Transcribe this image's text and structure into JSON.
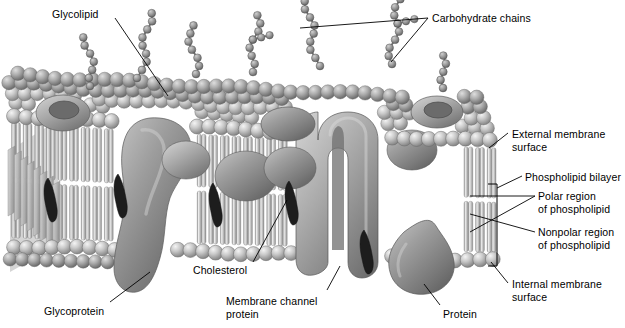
{
  "figure": {
    "width": 625,
    "height": 328,
    "background": "#ffffff"
  },
  "palette": {
    "head_light": "#e9e9e9",
    "head_mid": "#b8b8b8",
    "head_dark": "#7e7e7e",
    "tail_light": "#dcdcdc",
    "tail_mid": "#aeaeae",
    "protein_light": "#b0b0b0",
    "protein_mid": "#8a8a8a",
    "protein_dark": "#5f5f5f",
    "carb_light": "#bdbdbd",
    "carb_dark": "#6e6e6e",
    "cholesterol": "#1c1c1c",
    "interior": "#f2f2f2",
    "outline": "#4a4a4a",
    "leader": "#000000",
    "text": "#000000"
  },
  "labels": [
    {
      "id": "glycolipid",
      "text": "Glycolipid",
      "x": 52,
      "y": 8,
      "align": "left"
    },
    {
      "id": "carbohydrate-chains",
      "text": "Carbohydrate chains",
      "x": 432,
      "y": 12,
      "align": "left"
    },
    {
      "id": "external-membrane",
      "text": "External membrane\nsurface",
      "x": 512,
      "y": 128,
      "align": "left"
    },
    {
      "id": "phospholipid-bilayer",
      "text": "Phospholipid bilayer",
      "x": 525,
      "y": 171,
      "align": "left"
    },
    {
      "id": "polar-region",
      "text": "Polar region\nof phospholipid",
      "x": 538,
      "y": 190,
      "align": "left"
    },
    {
      "id": "nonpolar-region",
      "text": "Nonpolar region\nof phospholipid",
      "x": 538,
      "y": 226,
      "align": "left"
    },
    {
      "id": "internal-membrane",
      "text": "Internal membrane\nsurface",
      "x": 512,
      "y": 278,
      "align": "left"
    },
    {
      "id": "glycoprotein",
      "text": "Glycoprotein",
      "x": 44,
      "y": 305,
      "align": "left"
    },
    {
      "id": "cholesterol",
      "text": "Cholesterol",
      "x": 193,
      "y": 264,
      "align": "left"
    },
    {
      "id": "membrane-channel",
      "text": "Membrane channel\nprotein",
      "x": 226,
      "y": 295,
      "align": "left"
    },
    {
      "id": "protein",
      "text": "Protein",
      "x": 443,
      "y": 308,
      "align": "left"
    }
  ],
  "leaders": [
    {
      "id": "leader-glycolipid",
      "points": "115,18 168,96"
    },
    {
      "id": "leader-carb-a",
      "points": "428,18 300,28"
    },
    {
      "id": "leader-carb-b",
      "points": "428,18 391,62"
    },
    {
      "id": "leader-external",
      "points": "508,133 489,148"
    },
    {
      "id": "leader-bilayer",
      "points": "522,176 497,188"
    },
    {
      "id": "leader-polar-top",
      "points": "535,196 470,196"
    },
    {
      "id": "leader-polar-lower",
      "points": "535,196 470,232"
    },
    {
      "id": "leader-nonpolar",
      "points": "535,232 470,214"
    },
    {
      "id": "leader-internal",
      "points": "508,283 491,262"
    },
    {
      "id": "leader-glycoprotein",
      "points": "110,302 150,272"
    },
    {
      "id": "leader-cholesterol",
      "points": "253,262 287,200"
    },
    {
      "id": "leader-channel",
      "points": "327,290 340,266"
    },
    {
      "id": "leader-protein",
      "points": "440,305 424,284"
    }
  ],
  "bracket": {
    "id": "bilayer-bracket",
    "x": 497,
    "top": 184,
    "bottom": 266,
    "arm": 9
  },
  "structures": {
    "bilayer": {
      "outer_heads_rows": 2,
      "inner_heads_rows": 1,
      "tails_visible": true,
      "description": "Phospholipid bilayer with spherical polar head groups and paired nonpolar tails"
    },
    "proteins": [
      {
        "id": "glycoprotein",
        "type": "integral",
        "cx": 152,
        "cy": 205
      },
      {
        "id": "channel-protein",
        "type": "channel",
        "cx": 339,
        "cy": 210
      },
      {
        "id": "peripheral-protein",
        "type": "peripheral",
        "cx": 424,
        "cy": 268
      },
      {
        "id": "embedded-blob-a",
        "type": "integral",
        "cx": 246,
        "cy": 185
      },
      {
        "id": "embedded-blob-b",
        "type": "integral",
        "cx": 286,
        "cy": 178
      }
    ],
    "carbohydrate_chains": [
      {
        "id": "chain-1",
        "base_x": 90,
        "base_y": 86,
        "beads": 7,
        "branch": false
      },
      {
        "id": "chain-2",
        "base_x": 137,
        "base_y": 78,
        "beads": 9,
        "branch": false
      },
      {
        "id": "chain-3",
        "base_x": 196,
        "base_y": 74,
        "beads": 7,
        "branch": false
      },
      {
        "id": "chain-4",
        "base_x": 253,
        "base_y": 72,
        "beads": 8,
        "branch": true
      },
      {
        "id": "chain-5",
        "base_x": 320,
        "base_y": 66,
        "beads": 9,
        "branch": false
      },
      {
        "id": "chain-6",
        "base_x": 392,
        "base_y": 64,
        "beads": 9,
        "branch": true
      },
      {
        "id": "chain-7",
        "base_x": 443,
        "base_y": 88,
        "beads": 5,
        "branch": false
      }
    ],
    "cholesterol_molecules": [
      {
        "id": "chol-1",
        "x": 48,
        "y": 200
      },
      {
        "id": "chol-2",
        "x": 118,
        "y": 196
      },
      {
        "id": "chol-3",
        "x": 213,
        "y": 205
      },
      {
        "id": "chol-4",
        "x": 289,
        "y": 203
      },
      {
        "id": "chol-5",
        "x": 364,
        "y": 252
      }
    ]
  }
}
